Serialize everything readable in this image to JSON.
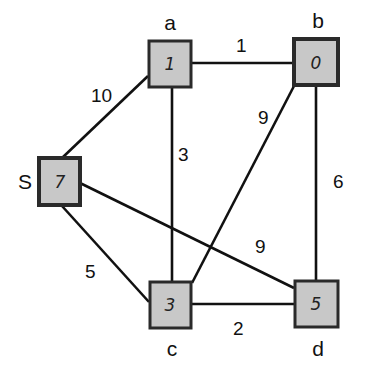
{
  "diagram": {
    "type": "weighted-graph",
    "nodes": [
      {
        "id": "S",
        "label": "S",
        "value": "7"
      },
      {
        "id": "a",
        "label": "a",
        "value": "1"
      },
      {
        "id": "b",
        "label": "b",
        "value": "0"
      },
      {
        "id": "c",
        "label": "c",
        "value": "3"
      },
      {
        "id": "d",
        "label": "d",
        "value": "5"
      }
    ],
    "edges": [
      {
        "from": "a",
        "to": "b",
        "weight": "1"
      },
      {
        "from": "S",
        "to": "a",
        "weight": "10"
      },
      {
        "from": "a",
        "to": "c",
        "weight": "3"
      },
      {
        "from": "b",
        "to": "c",
        "weight": "9"
      },
      {
        "from": "b",
        "to": "d",
        "weight": "6"
      },
      {
        "from": "S",
        "to": "d",
        "weight": "9"
      },
      {
        "from": "S",
        "to": "c",
        "weight": "5"
      },
      {
        "from": "c",
        "to": "d",
        "weight": "2"
      }
    ]
  }
}
